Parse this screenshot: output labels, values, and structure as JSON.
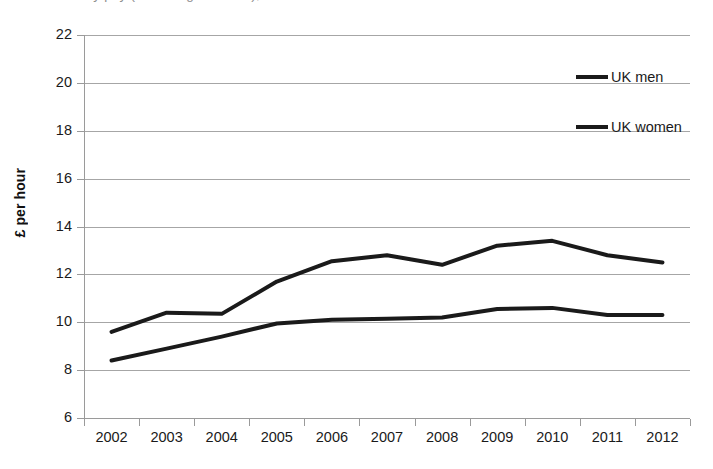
{
  "title_partial": "Hourly pay (excluding overtime), UK men and UK women",
  "legend": {
    "position": "top-right",
    "entries": [
      {
        "label": "UK men",
        "color": "#1a1a1a"
      },
      {
        "label": "UK women",
        "color": "#1a1a1a"
      }
    ]
  },
  "axes": {
    "y_title": "£ per hour",
    "y_ticks": [
      "6",
      "8",
      "10",
      "12",
      "14",
      "16",
      "18",
      "20",
      "22"
    ],
    "x_ticks": [
      "2002",
      "2003",
      "2004",
      "2005",
      "2006",
      "2007",
      "2008",
      "2009",
      "2010",
      "2011",
      "2012"
    ]
  },
  "chart_data": {
    "type": "line",
    "title": "Hourly pay (excluding overtime), UK men and UK women",
    "xlabel": "",
    "ylabel": "£ per hour",
    "ylim": [
      6,
      22
    ],
    "ytick_step": 2,
    "grid": true,
    "legend_position": "top-right",
    "categories": [
      "2002",
      "2003",
      "2004",
      "2005",
      "2006",
      "2007",
      "2008",
      "2009",
      "2010",
      "2011",
      "2012"
    ],
    "series": [
      {
        "name": "UK men",
        "color": "#1a1a1a",
        "values": [
          9.6,
          10.4,
          10.35,
          11.7,
          12.55,
          12.8,
          12.4,
          13.2,
          13.4,
          12.8,
          12.5
        ]
      },
      {
        "name": "UK women",
        "color": "#1a1a1a",
        "values": [
          8.4,
          8.9,
          9.4,
          9.95,
          10.1,
          10.15,
          10.2,
          10.55,
          10.6,
          10.3,
          10.3
        ]
      }
    ]
  }
}
